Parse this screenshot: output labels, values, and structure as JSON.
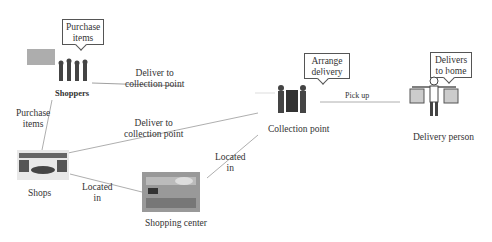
{
  "nodes": {
    "shoppers": {
      "label": "Shoppers",
      "callout": [
        "Purchase",
        "items"
      ]
    },
    "shops": {
      "label": "Shops"
    },
    "shopping_center": {
      "label": "Shopping center"
    },
    "collection_point": {
      "label": "Collection point",
      "callout": [
        "Arrange",
        "delivery"
      ]
    },
    "delivery_person": {
      "label": "Delivery person",
      "callout": [
        "Delivers",
        "to home"
      ]
    }
  },
  "edges": {
    "shoppers_to_cp": [
      "Deliver to",
      "collection point"
    ],
    "shops_to_cp": [
      "Deliver to",
      "collection point"
    ],
    "shoppers_shops": [
      "Purchase",
      "items"
    ],
    "shops_center": [
      "Located",
      "in"
    ],
    "center_cp": [
      "Located",
      "in"
    ],
    "cp_delivery": "Pick up"
  }
}
